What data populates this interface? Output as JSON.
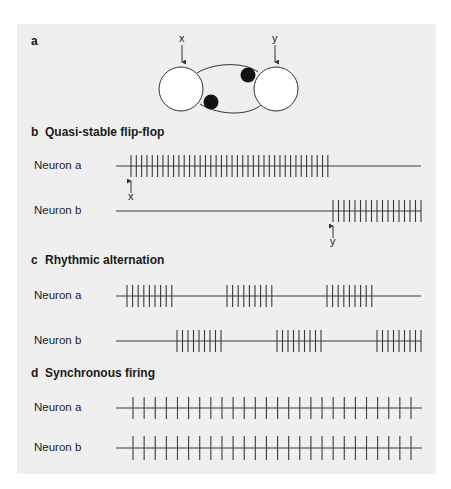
{
  "panel_a": {
    "letter": "a",
    "neuron_a_label": "a",
    "neuron_b_label": "b",
    "input_x_label": "x",
    "input_y_label": "y"
  },
  "sections": [
    {
      "id": "b",
      "letter": "b",
      "title": "Quasi-stable flip-flop",
      "title_y": 131,
      "traces": [
        {
          "label": "Neuron a",
          "baseline_y": 166,
          "spike_half": 11,
          "line_x0": 116,
          "line_x1": 421,
          "spikes": {
            "start": 131,
            "count": 38,
            "spacing": 5.32
          }
        },
        {
          "label": "Neuron b",
          "baseline_y": 211,
          "spike_half": 11,
          "line_x0": 116,
          "line_x1": 421,
          "spikes": {
            "start": 333,
            "count": 17,
            "spacing": 5.5
          }
        }
      ],
      "markers": [
        {
          "label": "x",
          "x": 131,
          "arrow_top": 181,
          "arrow_bottom": 193,
          "text_y": 196
        },
        {
          "label": "y",
          "x": 333,
          "arrow_top": 226,
          "arrow_bottom": 238,
          "text_y": 241
        }
      ]
    },
    {
      "id": "c",
      "letter": "c",
      "title": "Rhythmic alternation",
      "title_y": 259,
      "traces": [
        {
          "label": "Neuron a",
          "baseline_y": 296,
          "spike_half": 11,
          "line_x0": 116,
          "line_x1": 421,
          "bursts": [
            {
              "start": 127,
              "count": 9,
              "spacing": 5.6
            },
            {
              "start": 227,
              "count": 9,
              "spacing": 5.6
            },
            {
              "start": 327,
              "count": 9,
              "spacing": 5.6
            }
          ]
        },
        {
          "label": "Neuron b",
          "baseline_y": 341,
          "spike_half": 11,
          "line_x0": 116,
          "line_x1": 421,
          "bursts": [
            {
              "start": 177,
              "count": 9,
              "spacing": 5.5
            },
            {
              "start": 277,
              "count": 9,
              "spacing": 5.5
            },
            {
              "start": 377,
              "count": 9,
              "spacing": 5.5
            }
          ]
        }
      ]
    },
    {
      "id": "d",
      "letter": "d",
      "title": "Synchronous firing",
      "title_y": 372,
      "traces": [
        {
          "label": "Neuron a",
          "baseline_y": 408,
          "spike_half": 11,
          "line_x0": 116,
          "line_x1": 422,
          "spikes": {
            "start": 133,
            "count": 26,
            "spacing": 11.12
          }
        },
        {
          "label": "Neuron b",
          "baseline_y": 448,
          "spike_half": 12,
          "line_x0": 116,
          "line_x1": 422,
          "spikes": {
            "start": 133,
            "count": 26,
            "spacing": 11.12
          }
        }
      ]
    }
  ],
  "colors": {
    "panel_bg": "#efefef",
    "ink": "#3a3a3a",
    "synapse": "#111111",
    "cell_fill": "#ffffff"
  }
}
